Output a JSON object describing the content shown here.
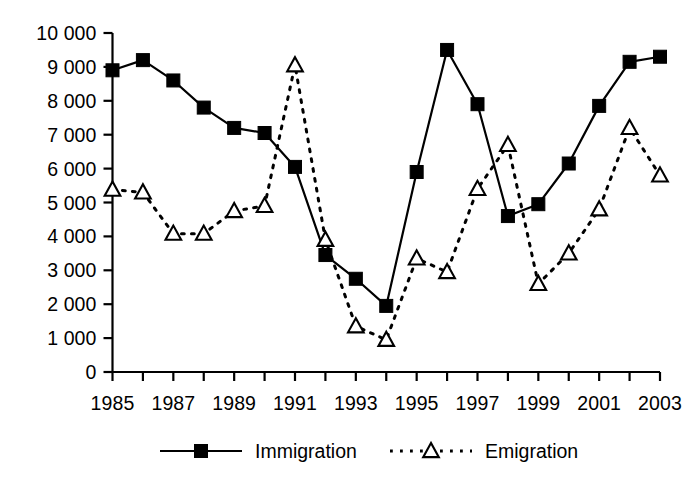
{
  "chart_data": {
    "type": "line",
    "title": "",
    "subtitle": "",
    "xlabel": "",
    "ylabel": "",
    "x": [
      1985,
      1986,
      1987,
      1988,
      1989,
      1990,
      1991,
      1992,
      1993,
      1994,
      1995,
      1996,
      1997,
      1998,
      1999,
      2000,
      2001,
      2002,
      2003
    ],
    "categories": [
      "1985",
      "1986",
      "1987",
      "1988",
      "1989",
      "1990",
      "1991",
      "1992",
      "1993",
      "1994",
      "1995",
      "1996",
      "1997",
      "1998",
      "1999",
      "2000",
      "2001",
      "2002",
      "2003"
    ],
    "xlim": [
      1985,
      2003
    ],
    "ylim": [
      0,
      10000
    ],
    "ytick_values": [
      0,
      1000,
      2000,
      3000,
      4000,
      5000,
      6000,
      7000,
      8000,
      9000,
      10000
    ],
    "ytick_labels": [
      "0",
      "1 000",
      "2 000",
      "3 000",
      "4 000",
      "5 000",
      "6 000",
      "7 000",
      "8 000",
      "9 000",
      "10 000"
    ],
    "xtick_values": [
      1985,
      1986,
      1987,
      1988,
      1989,
      1990,
      1991,
      1992,
      1993,
      1994,
      1995,
      1996,
      1997,
      1998,
      1999,
      2000,
      2001,
      2002,
      2003
    ],
    "xtick_labels_shown": [
      "1985",
      "1987",
      "1989",
      "1991",
      "1993",
      "1995",
      "1997",
      "1999",
      "2001",
      "2003"
    ],
    "grid": false,
    "legend_position": "bottom",
    "series": [
      {
        "name": "Immigration",
        "marker": "filled-square",
        "line_style": "solid",
        "color": "#000000",
        "values": [
          8900,
          9200,
          8600,
          7800,
          7200,
          7050,
          6050,
          3450,
          2750,
          1950,
          5900,
          9500,
          7900,
          4600,
          4950,
          6150,
          7850,
          9150,
          9300
        ]
      },
      {
        "name": "Emigration",
        "marker": "open-triangle",
        "line_style": "dotted",
        "color": "#000000",
        "values": [
          5380,
          5300,
          4080,
          4080,
          4750,
          4900,
          9050,
          3900,
          1350,
          950,
          3350,
          2950,
          5400,
          6700,
          2600,
          3500,
          4800,
          7200,
          5800
        ]
      }
    ]
  },
  "legend": {
    "items": [
      {
        "label": "Immigration",
        "marker": "filled-square",
        "line_style": "solid"
      },
      {
        "label": "Emigration",
        "marker": "open-triangle",
        "line_style": "dotted"
      }
    ]
  },
  "axes": {
    "y_axis_name": "value-axis",
    "x_axis_name": "year-axis"
  }
}
